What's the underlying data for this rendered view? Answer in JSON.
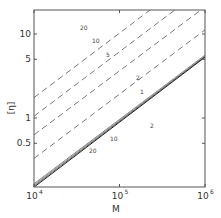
{
  "chart_data": {
    "type": "line",
    "title": "",
    "xlabel": "M",
    "ylabel": "[η]",
    "xscale": "log",
    "yscale": "log",
    "xlim": [
      10000,
      1000000
    ],
    "ylim": [
      0.2,
      15
    ],
    "x_ticks": [
      {
        "value": 10000,
        "label": "10",
        "exp": "4"
      },
      {
        "value": 100000,
        "label": "10",
        "exp": "5"
      },
      {
        "value": 1000000,
        "label": "10",
        "exp": "6"
      }
    ],
    "y_ticks": [
      {
        "value": 10,
        "label": "10"
      },
      {
        "value": 5,
        "label": "5"
      },
      {
        "value": 1,
        "label": "1"
      },
      {
        "value": 0.5,
        "label": "0.5"
      }
    ],
    "grid": false,
    "legend": "none",
    "series": [
      {
        "name": "20 (dashed)",
        "style": "dashed",
        "x": [
          10000,
          1000000
        ],
        "y": [
          1.75,
          60
        ],
        "label": "20",
        "label_pos": [
          80,
          30
        ]
      },
      {
        "name": "10 (dashed)",
        "style": "dashed",
        "x": [
          10000,
          1000000
        ],
        "y": [
          1.05,
          36
        ],
        "label": "10",
        "label_pos": [
          92,
          43
        ]
      },
      {
        "name": "5 (dashed)",
        "style": "dashed",
        "x": [
          10000,
          1000000
        ],
        "y": [
          0.63,
          21
        ],
        "label": "5",
        "label_pos": [
          106,
          57
        ]
      },
      {
        "name": "2 (dashed)",
        "style": "dashed",
        "x": [
          10000,
          1000000
        ],
        "y": [
          0.33,
          11.2
        ],
        "label": "2",
        "label_pos": [
          136,
          80
        ]
      },
      {
        "name": "1 (solid)",
        "style": "solid",
        "x": [
          10000,
          1000000
        ],
        "y": [
          0.165,
          5.6
        ],
        "label": "1",
        "label_pos": [
          140,
          94
        ]
      },
      {
        "name": "2 (solid)",
        "style": "solid",
        "x": [
          10000,
          1000000
        ],
        "y": [
          0.16,
          5.5
        ],
        "label": "2",
        "label_pos": [
          150,
          128
        ]
      },
      {
        "name": "10 (solid)",
        "style": "solid",
        "x": [
          10000,
          1000000
        ],
        "y": [
          0.155,
          5.4
        ],
        "label": "10",
        "label_pos": [
          110,
          141
        ]
      },
      {
        "name": "20 (solid)",
        "style": "solid",
        "x": [
          10000,
          1000000
        ],
        "y": [
          0.15,
          5.3
        ],
        "label": "20",
        "label_pos": [
          89,
          153
        ]
      }
    ]
  }
}
